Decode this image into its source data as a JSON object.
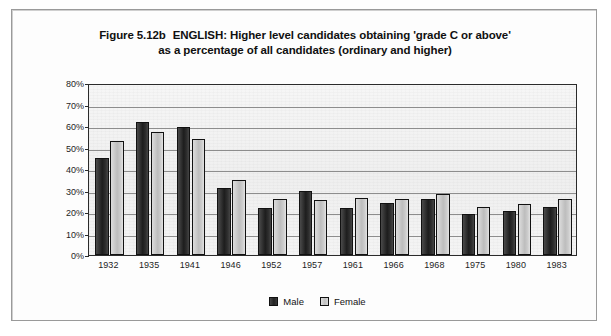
{
  "figure": {
    "number": "Figure 5.12b",
    "title_line1": "ENGLISH: Higher level candidates obtaining 'grade C or above'",
    "title_line2": "as a percentage of all candidates (ordinary and higher)"
  },
  "legend": {
    "male_label": "Male",
    "female_label": "Female"
  },
  "chart_data": {
    "type": "bar",
    "xlabel": "",
    "ylabel": "",
    "ylim": [
      0,
      80
    ],
    "ytick_labels": [
      "0%",
      "10%",
      "20%",
      "30%",
      "40%",
      "50%",
      "60%",
      "70%",
      "80%"
    ],
    "ytick_values": [
      0,
      10,
      20,
      30,
      40,
      50,
      60,
      70,
      80
    ],
    "grid": true,
    "legend_position": "bottom-center",
    "categories": [
      "1932",
      "1935",
      "1941",
      "1946",
      "1952",
      "1957",
      "1961",
      "1966",
      "1968",
      "1975",
      "1980",
      "1983"
    ],
    "series": [
      {
        "name": "Male",
        "color": "#242424",
        "values": [
          45,
          62,
          59.5,
          31,
          22,
          30,
          22,
          24,
          26,
          19,
          20.5,
          22.5
        ]
      },
      {
        "name": "Female",
        "color": "#c8c8c8",
        "values": [
          53,
          57,
          54,
          35,
          26,
          25.5,
          26.5,
          26,
          28.5,
          22.5,
          23.5,
          26
        ]
      }
    ]
  }
}
